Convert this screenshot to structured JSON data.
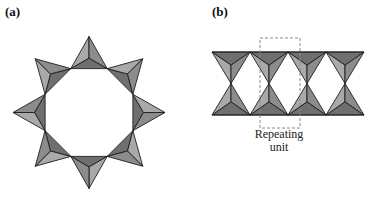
{
  "panels": [
    {
      "label": "(a)",
      "description": "Cyclic ring of eight corner-sharing tetrahedra"
    },
    {
      "label": "(b)",
      "description": "Double chain of corner-sharing tetrahedra",
      "caption_line1": "Repeating",
      "caption_line2": "unit"
    }
  ],
  "colors": {
    "light_face": "#a9a9a9",
    "mid_face": "#8c8c8c",
    "dark_face": "#6f6f6f",
    "edge": "#1e1e1e",
    "dashed_box": "#8a8a8a"
  }
}
